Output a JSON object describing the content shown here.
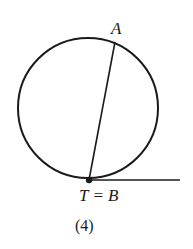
{
  "figure": {
    "caption": "(4)",
    "colors": {
      "stroke": "#1a1a1a",
      "background": "#ffffff"
    }
  },
  "circle": {
    "cx": 88,
    "cy": 108,
    "r": 70
  },
  "points": {
    "A": {
      "label": "A",
      "x": 115,
      "y": 42
    },
    "T": {
      "label": "T = B",
      "x": 89,
      "y": 180
    }
  },
  "segments": {
    "chord": {
      "from": "T",
      "to": "A"
    },
    "tangent": {
      "from": "T",
      "x2": 180,
      "y2": 180
    }
  }
}
